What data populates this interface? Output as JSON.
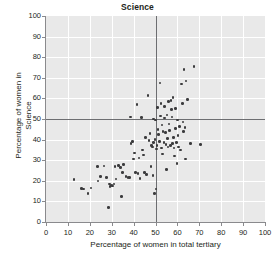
{
  "chart_data": {
    "type": "scatter",
    "title": "Science",
    "xlabel": "Percentage of women in total tertiary",
    "ylabel_line1": "Percentage of women in",
    "ylabel_line2": "Science",
    "xlim": [
      0,
      100
    ],
    "ylim": [
      0,
      100
    ],
    "xticks": [
      0,
      10,
      20,
      30,
      40,
      50,
      60,
      70,
      80,
      90,
      100
    ],
    "yticks": [
      0,
      10,
      20,
      30,
      40,
      50,
      60,
      70,
      80,
      90,
      100
    ],
    "grid": true,
    "grid_color": "#ffffff",
    "plot_background": "#e9e9e9",
    "point_color": "#3b3b3d",
    "reference_lines": {
      "vertical_x": 50,
      "horizontal_y": 50,
      "color": "#6d6e71"
    },
    "legend": null,
    "points": [
      [
        12.8,
        20.5
      ],
      [
        16.2,
        16.3
      ],
      [
        17.0,
        16.0
      ],
      [
        19.2,
        13.8
      ],
      [
        20.5,
        16.5
      ],
      [
        23.5,
        27.0
      ],
      [
        23.8,
        20.0
      ],
      [
        25.0,
        22.0
      ],
      [
        26.5,
        27.2
      ],
      [
        27.5,
        21.5
      ],
      [
        28.5,
        6.9
      ],
      [
        29.0,
        18.5
      ],
      [
        29.3,
        17.3
      ],
      [
        29.6,
        17.8
      ],
      [
        30.2,
        18.0
      ],
      [
        30.5,
        17.5
      ],
      [
        31.0,
        18.4
      ],
      [
        31.5,
        26.8
      ],
      [
        32.0,
        20.9
      ],
      [
        33.0,
        27.4
      ],
      [
        34.0,
        26.5
      ],
      [
        34.5,
        12.3
      ],
      [
        35.0,
        24.0
      ],
      [
        35.5,
        28.0
      ],
      [
        36.5,
        22.0
      ],
      [
        37.5,
        21.5
      ],
      [
        38.0,
        21.6
      ],
      [
        38.5,
        51.0
      ],
      [
        38.8,
        38.0
      ],
      [
        39.5,
        39.0
      ],
      [
        40.0,
        30.5
      ],
      [
        40.5,
        33.5
      ],
      [
        41.0,
        24.0
      ],
      [
        41.5,
        57.0
      ],
      [
        42.0,
        23.5
      ],
      [
        42.5,
        31.0
      ],
      [
        43.0,
        21.0
      ],
      [
        43.5,
        50.7
      ],
      [
        44.0,
        35.0
      ],
      [
        44.5,
        32.5
      ],
      [
        45.0,
        24.0
      ],
      [
        45.5,
        41.0
      ],
      [
        46.0,
        23.0
      ],
      [
        46.5,
        61.5
      ],
      [
        47.0,
        39.5
      ],
      [
        47.5,
        43.0
      ],
      [
        48.0,
        27.0
      ],
      [
        48.2,
        37.0
      ],
      [
        48.5,
        36.5
      ],
      [
        48.8,
        22.5
      ],
      [
        49.0,
        38.5
      ],
      [
        49.2,
        50.0
      ],
      [
        49.5,
        13.8
      ],
      [
        49.8,
        40.0
      ],
      [
        50.0,
        49.5
      ],
      [
        50.2,
        16.0
      ],
      [
        50.5,
        35.5
      ],
      [
        50.6,
        37.0
      ],
      [
        51.0,
        55.5
      ],
      [
        51.2,
        45.0
      ],
      [
        51.5,
        42.5
      ],
      [
        51.8,
        39.0
      ],
      [
        52.0,
        67.5
      ],
      [
        52.2,
        51.5
      ],
      [
        52.5,
        57.5
      ],
      [
        52.8,
        36.0
      ],
      [
        53.0,
        47.0
      ],
      [
        53.2,
        33.0
      ],
      [
        53.5,
        44.0
      ],
      [
        53.8,
        38.5
      ],
      [
        54.0,
        50.5
      ],
      [
        54.2,
        56.0
      ],
      [
        54.5,
        43.5
      ],
      [
        54.8,
        37.5
      ],
      [
        55.0,
        25.5
      ],
      [
        55.2,
        52.0
      ],
      [
        55.5,
        40.5
      ],
      [
        55.8,
        36.5
      ],
      [
        56.0,
        58.5
      ],
      [
        56.2,
        47.5
      ],
      [
        56.5,
        44.5
      ],
      [
        56.8,
        37.0
      ],
      [
        57.0,
        59.0
      ],
      [
        57.2,
        54.5
      ],
      [
        57.5,
        51.0
      ],
      [
        57.8,
        38.0
      ],
      [
        58.0,
        60.5
      ],
      [
        58.2,
        41.0
      ],
      [
        58.5,
        36.0
      ],
      [
        58.8,
        32.0
      ],
      [
        59.0,
        55.0
      ],
      [
        59.2,
        45.5
      ],
      [
        59.5,
        38.5
      ],
      [
        59.8,
        28.5
      ],
      [
        60.0,
        49.5
      ],
      [
        60.2,
        42.0
      ],
      [
        60.5,
        36.5
      ],
      [
        61.0,
        46.5
      ],
      [
        61.5,
        35.0
      ],
      [
        62.0,
        67.0
      ],
      [
        62.2,
        57.5
      ],
      [
        62.5,
        48.5
      ],
      [
        62.8,
        44.0
      ],
      [
        63.0,
        74.0
      ],
      [
        63.5,
        46.0
      ],
      [
        63.8,
        30.5
      ],
      [
        64.0,
        68.5
      ],
      [
        64.5,
        59.5
      ],
      [
        66.0,
        38.0
      ],
      [
        67.5,
        75.5
      ],
      [
        70.5,
        37.5
      ]
    ]
  }
}
